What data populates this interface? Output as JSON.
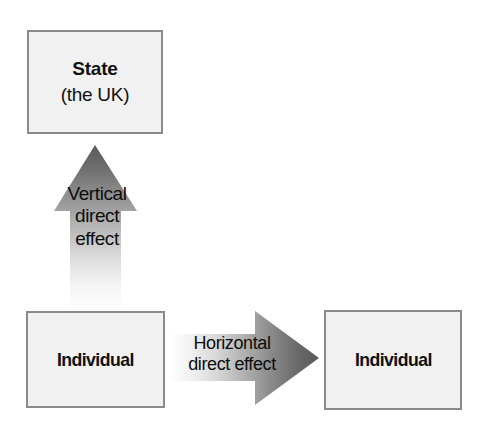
{
  "diagram": {
    "background_color": "#ffffff",
    "node_fill_color": "#f1f1f1",
    "node_border_color": "#8a8a8a",
    "arrow_dark_color": "#5e5e5e",
    "arrow_light_color": "#ffffff",
    "text_color": "#111111",
    "nodes": [
      {
        "id": "state",
        "title": "State",
        "subtitle": "(the UK)"
      },
      {
        "id": "individual-left",
        "title": "Individual"
      },
      {
        "id": "individual-right",
        "title": "Individual"
      }
    ],
    "arrows": [
      {
        "id": "vertical",
        "direction": "up",
        "from": "individual-left",
        "to": "state",
        "caption_line_1": "Vertical",
        "caption_line_2": "direct",
        "caption_line_3": "effect",
        "gradient": "light-bottom-to-dark-top"
      },
      {
        "id": "horizontal",
        "direction": "right",
        "from": "individual-left",
        "to": "individual-right",
        "caption_line_1": "Horizontal",
        "caption_line_2": "direct effect",
        "gradient": "light-left-to-dark-right"
      }
    ]
  }
}
